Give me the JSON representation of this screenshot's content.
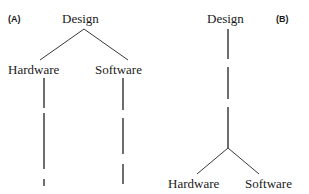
{
  "figure": {
    "background_color": "#ffffff",
    "ink_color": "#1a1a1a",
    "line_color": "#3a3a3a",
    "width": 309,
    "height": 194
  },
  "panels": [
    {
      "id": "A",
      "label": "(A)",
      "label_x": 8,
      "label_y": 14,
      "root": {
        "text": "Design",
        "x": 62,
        "y": 12
      },
      "children": [
        {
          "text": "Hardware",
          "x": 8,
          "y": 63
        },
        {
          "text": "Software",
          "x": 95,
          "y": 63
        }
      ],
      "edges": [
        {
          "type": "solid",
          "x1": 84,
          "y1": 29,
          "x2": 40,
          "y2": 60
        },
        {
          "type": "solid",
          "x1": 84,
          "y1": 29,
          "x2": 128,
          "y2": 60
        },
        {
          "type": "dashed",
          "x1": 44,
          "y1": 78,
          "x2": 44,
          "y2": 186
        },
        {
          "type": "dashed",
          "x1": 123,
          "y1": 78,
          "x2": 123,
          "y2": 184
        }
      ]
    },
    {
      "id": "B",
      "label": "(B)",
      "label_x": 276,
      "label_y": 14,
      "root": {
        "text": "Design",
        "x": 207,
        "y": 12
      },
      "children": [
        {
          "text": "Hardware",
          "x": 168,
          "y": 177
        },
        {
          "text": "Software",
          "x": 245,
          "y": 177
        }
      ],
      "edges": [
        {
          "type": "dashed",
          "x1": 228,
          "y1": 29,
          "x2": 228,
          "y2": 148
        },
        {
          "type": "solid",
          "x1": 228,
          "y1": 148,
          "x2": 197,
          "y2": 174
        },
        {
          "type": "solid",
          "x1": 228,
          "y1": 148,
          "x2": 259,
          "y2": 174
        }
      ]
    }
  ]
}
